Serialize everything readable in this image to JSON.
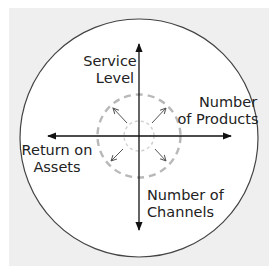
{
  "diagram": {
    "type": "radial-axes",
    "colors": {
      "background_panel": "#efefef",
      "circle_fill": "#ffffff",
      "circle_stroke": "#444444",
      "axis_stroke": "#111111",
      "dashed_circle_stroke": "#b8b8b8",
      "small_dashed_circle_stroke": "#cfcfcf",
      "diagonal_arrow_stroke": "#555555",
      "text": "#222222"
    },
    "axes": {
      "up": {
        "label_line1": "Service",
        "label_line2": "Level"
      },
      "right": {
        "label_line1": "Number",
        "label_line2": "of Products"
      },
      "down": {
        "label_line1": "Number of",
        "label_line2": "Channels"
      },
      "left": {
        "label_line1": "Return on",
        "label_line2": "Assets"
      }
    },
    "expansion_arrows": [
      "north-west",
      "north-east",
      "south-west",
      "south-east"
    ]
  }
}
